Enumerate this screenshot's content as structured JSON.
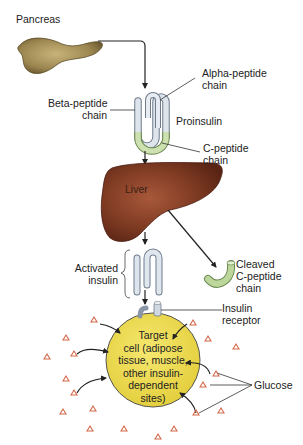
{
  "diagram": {
    "nodes": {
      "pancreas": {
        "label": "Pancreas"
      },
      "proinsulin": {
        "label": "Proinsulin",
        "parts": {
          "alpha": {
            "label_line1": "Alpha-peptide",
            "label_line2": "chain"
          },
          "beta": {
            "label_line1": "Beta-peptide",
            "label_line2": "chain"
          },
          "cpeptide": {
            "label_line1": "C-peptide",
            "label_line2": "chain"
          }
        }
      },
      "liver": {
        "label": "Liver"
      },
      "activated_insulin": {
        "label_line1": "Activated",
        "label_line2": "insulin"
      },
      "cleaved_cpeptide": {
        "label_line1": "Cleaved",
        "label_line2": "C-peptide",
        "label_line3": "chain"
      },
      "insulin_receptor": {
        "label_line1": "Insulin",
        "label_line2": "receptor"
      },
      "target_cell": {
        "lines": [
          "Target",
          "cell (adipose",
          "tissue, muscle,",
          "other insulin-",
          "dependent",
          "sites)"
        ]
      },
      "glucose": {
        "label": "Glucose"
      }
    },
    "edges": [
      {
        "from": "pancreas",
        "to": "proinsulin"
      },
      {
        "from": "proinsulin",
        "to": "liver"
      },
      {
        "from": "liver",
        "to": "activated_insulin"
      },
      {
        "from": "liver",
        "to": "cleaved_cpeptide"
      },
      {
        "from": "activated_insulin",
        "to": "insulin_receptor"
      },
      {
        "from": "glucose",
        "to": "target_cell"
      }
    ],
    "colors": {
      "pancreas": "#a08a52",
      "liver": "#7a3a22",
      "peptide_chain": "#d6dde6",
      "cpeptide": "#c9dcae",
      "target_cell": "#f0e060",
      "glucose": "#d4684a",
      "arrow": "#222222"
    }
  }
}
